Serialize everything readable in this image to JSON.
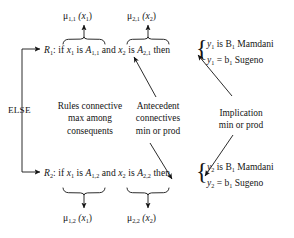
{
  "figure": {
    "background_color": "#ffffff",
    "ink_color": "#141414"
  },
  "top_outputs": [
    {
      "text": "μ",
      "sub": "1,1",
      "arg": "(x",
      "argsub": "1",
      "argclose": ")",
      "full": "μ1,1 (x1)"
    },
    {
      "text": "μ",
      "sub": "2,1",
      "arg": "(x",
      "argsub": "2",
      "argclose": ")",
      "full": "μ2,1 (x2)"
    }
  ],
  "bottom_outputs": [
    {
      "text": "μ",
      "sub": "1,2",
      "arg": "(x",
      "argsub": "1",
      "argclose": ")",
      "full": "μ1,2 (x1)"
    },
    {
      "text": "μ",
      "sub": "2,2",
      "arg": "(x",
      "argsub": "2",
      "argclose": ")",
      "full": "μ2,2 (x2)"
    }
  ],
  "rule1": {
    "name": "R",
    "name_sub": "1",
    "colon_if": ": if",
    "var1": "x",
    "var1_sub": "1",
    "is1": "is",
    "set1": "A",
    "set1_sub": "1,1",
    "and": "and",
    "var2": "x",
    "var2_sub": "2",
    "is2": "is",
    "set2": "A",
    "set2_sub": "2,1",
    "then": "then",
    "consequent_mamdani": "is B",
    "consequent_mamdani_sub": "1",
    "consequent_mamdani_tail": "Mamdani",
    "consequent_sugeno": "= b",
    "consequent_sugeno_sub": "1",
    "consequent_sugeno_tail": "Sugeno",
    "out_var": "y",
    "out_var_sub": "1"
  },
  "rule2": {
    "name": "R",
    "name_sub": "2",
    "colon_if": ": if",
    "var1": "x",
    "var1_sub": "1",
    "is1": "is",
    "set1": "A",
    "set1_sub": "1,2",
    "and": "and",
    "var2": "x",
    "var2_sub": "2",
    "is2": "is",
    "set2": "A",
    "set2_sub": "2,2",
    "then": "then",
    "consequent_mamdani": "is B",
    "consequent_mamdani_sub": "1",
    "consequent_mamdani_tail": "Mamdani",
    "consequent_sugeno": "= b",
    "consequent_sugeno_sub": "1",
    "consequent_sugeno_tail": "Sugeno",
    "out_var": "y",
    "out_var_sub": "2"
  },
  "annotations": {
    "else": "ELSE",
    "rules_connective": {
      "line1": "Rules connective",
      "line2": "max among",
      "line3": "consequents"
    },
    "antecedent": {
      "line1": "Antecedent",
      "line2": "connectives",
      "line3": "min or prod"
    },
    "implication": {
      "line1": "Implication",
      "line2": "min or prod"
    }
  },
  "glyphs": {
    "arrow_up": "↑",
    "arrow_down": "↓",
    "brace_left": "{"
  }
}
